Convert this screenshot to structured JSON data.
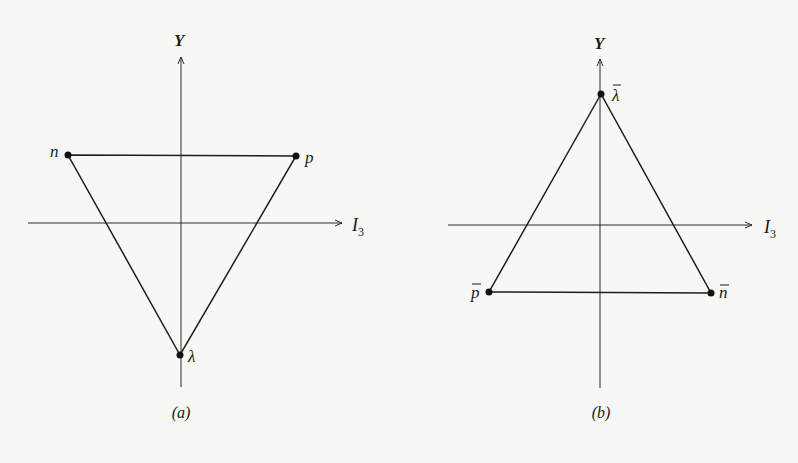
{
  "figure": {
    "panels": [
      {
        "id": "a",
        "caption": "(a)",
        "axes": {
          "y_label": "Y",
          "x_label": "I",
          "x_label_sub": "3"
        },
        "points": [
          {
            "label": "n",
            "overbar": false,
            "position": "top-left"
          },
          {
            "label": "p",
            "overbar": false,
            "position": "top-right"
          },
          {
            "label": "λ",
            "overbar": false,
            "position": "bottom"
          }
        ],
        "shape": "inverted-triangle"
      },
      {
        "id": "b",
        "caption": "(b)",
        "axes": {
          "y_label": "Y",
          "x_label": "I",
          "x_label_sub": "3"
        },
        "points": [
          {
            "label": "λ",
            "overbar": true,
            "position": "top"
          },
          {
            "label": "p",
            "overbar": true,
            "position": "bottom-left"
          },
          {
            "label": "n",
            "overbar": true,
            "position": "bottom-right"
          }
        ],
        "shape": "upright-triangle"
      }
    ]
  }
}
